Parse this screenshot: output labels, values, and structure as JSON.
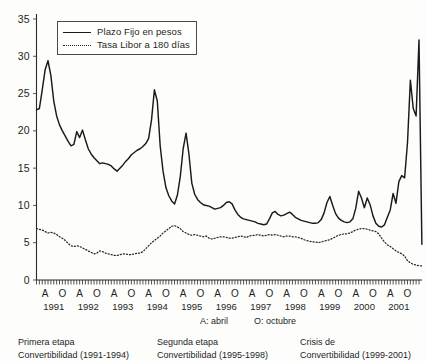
{
  "legend": {
    "entries": [
      {
        "label": "Plazo Fijo en pesos",
        "style": "solid"
      },
      {
        "label": "Tasa Libor a 180 días",
        "style": "dotted"
      }
    ]
  },
  "month_key": [
    {
      "label": "A: abril"
    },
    {
      "label": "O: octubre"
    }
  ],
  "captions": [
    {
      "line1": "Primera etapa",
      "line2": "Convertibilidad (1991-1994)"
    },
    {
      "line1": "Segunda etapa",
      "line2": "Convertibilidad (1995-1998)"
    },
    {
      "line1": "Crisis de",
      "line2": "Convertibilidad (1999-2001)"
    }
  ],
  "chart_data": {
    "type": "line",
    "title": "",
    "xlabel": "",
    "ylabel": "",
    "ylim": [
      0,
      35
    ],
    "ytick_labels": [
      "0",
      "5",
      "10",
      "15",
      "20",
      "25",
      "30",
      "35"
    ],
    "ytick_values": [
      0,
      5,
      10,
      15,
      20,
      25,
      30,
      35
    ],
    "grid": false,
    "legend_position": "top-left-inside",
    "x_minor_tick_interval_months": 1,
    "x_major_tick_labels": [
      "A",
      "O",
      "A",
      "O",
      "A",
      "O",
      "A",
      "O",
      "A",
      "O",
      "A",
      "O",
      "A",
      "O",
      "A",
      "O",
      "A",
      "O",
      "A",
      "O",
      "A",
      "O"
    ],
    "x_year_labels": [
      "1991",
      "1992",
      "1993",
      "1994",
      "1995",
      "1996",
      "1997",
      "1998",
      "1999",
      "2000",
      "2001"
    ],
    "x_start": "1991-01",
    "x_end": "1992-02",
    "x_range_months": 134,
    "series": [
      {
        "name": "Plazo Fijo en pesos",
        "style": "solid",
        "values": [
          22.8,
          23.0,
          25.5,
          28.2,
          29.4,
          27.4,
          24.0,
          22.0,
          20.8,
          20.0,
          19.3,
          18.6,
          18.0,
          18.2,
          19.9,
          19.1,
          20.1,
          18.8,
          17.6,
          16.9,
          16.4,
          16.0,
          15.6,
          15.7,
          15.6,
          15.5,
          15.3,
          14.9,
          14.6,
          15.0,
          15.4,
          15.9,
          16.3,
          16.8,
          17.1,
          17.4,
          17.6,
          17.9,
          18.3,
          19.0,
          21.5,
          25.5,
          24.0,
          18.0,
          14.6,
          12.4,
          11.3,
          10.6,
          10.2,
          11.4,
          13.9,
          17.6,
          19.7,
          16.9,
          13.0,
          11.5,
          10.8,
          10.4,
          10.1,
          10.0,
          9.9,
          9.7,
          9.5,
          9.6,
          9.7,
          10.0,
          10.4,
          10.5,
          10.2,
          9.4,
          8.8,
          8.4,
          8.2,
          8.1,
          8.0,
          7.9,
          7.8,
          7.6,
          7.5,
          7.4,
          7.5,
          8.2,
          9.0,
          9.2,
          8.8,
          8.6,
          8.7,
          8.9,
          9.1,
          8.8,
          8.4,
          8.2,
          8.0,
          7.9,
          7.8,
          7.7,
          7.6,
          7.6,
          7.7,
          8.1,
          9.0,
          10.4,
          11.2,
          10.0,
          8.9,
          8.3,
          8.0,
          7.8,
          7.7,
          7.8,
          8.2,
          9.6,
          11.9,
          11.0,
          9.7,
          11.0,
          10.1,
          8.6,
          7.6,
          7.2,
          7.1,
          7.4,
          8.4,
          9.4,
          11.6,
          10.3,
          13.2,
          14.0,
          13.7,
          18.4,
          26.8,
          23.0,
          22.0,
          32.2,
          4.8
        ]
      },
      {
        "name": "Tasa Libor a 180 días",
        "style": "dotted",
        "values": [
          6.9,
          6.8,
          6.7,
          6.5,
          6.3,
          6.4,
          6.3,
          6.1,
          5.8,
          5.6,
          5.3,
          4.9,
          4.6,
          4.5,
          4.6,
          4.5,
          4.3,
          4.1,
          3.9,
          3.7,
          3.5,
          3.6,
          3.9,
          3.8,
          3.6,
          3.5,
          3.4,
          3.3,
          3.3,
          3.4,
          3.5,
          3.5,
          3.4,
          3.4,
          3.5,
          3.6,
          3.6,
          3.8,
          4.2,
          4.6,
          5.0,
          5.3,
          5.6,
          5.9,
          6.3,
          6.6,
          6.9,
          7.2,
          7.3,
          7.1,
          6.9,
          6.5,
          6.3,
          6.1,
          6.0,
          6.1,
          6.0,
          5.9,
          5.8,
          5.9,
          5.6,
          5.5,
          5.6,
          5.7,
          5.8,
          5.8,
          5.7,
          5.6,
          5.6,
          5.7,
          5.8,
          5.9,
          5.8,
          5.7,
          5.9,
          6.0,
          6.0,
          6.1,
          6.0,
          5.9,
          6.0,
          6.1,
          6.0,
          6.1,
          6.0,
          5.9,
          5.8,
          5.9,
          5.9,
          5.8,
          5.8,
          5.7,
          5.6,
          5.4,
          5.3,
          5.2,
          5.1,
          5.1,
          5.0,
          5.1,
          5.2,
          5.3,
          5.4,
          5.6,
          5.8,
          6.0,
          6.1,
          6.2,
          6.2,
          6.3,
          6.5,
          6.7,
          6.8,
          6.9,
          6.9,
          6.8,
          6.7,
          6.6,
          6.5,
          6.2,
          5.6,
          5.1,
          4.7,
          4.5,
          4.2,
          3.9,
          3.7,
          3.5,
          3.2,
          2.6,
          2.3,
          2.1,
          2.0,
          1.9,
          1.9
        ]
      }
    ]
  }
}
